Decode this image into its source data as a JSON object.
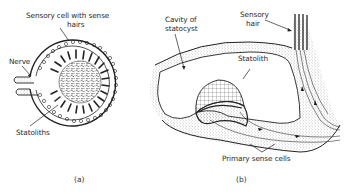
{
  "figure": {
    "panels": [
      {
        "id": "a",
        "caption": "(a)",
        "labels": {
          "sensory_cell": "Sensory cell with sense",
          "sensory_cell_line2": "hairs",
          "nerve": "Nerve",
          "statoliths": "Statoliths"
        }
      },
      {
        "id": "b",
        "caption": "(b)",
        "labels": {
          "cavity": "Cavity of",
          "cavity_line2": "statocyst",
          "sensory_hair": "Sensory",
          "sensory_hair_line2": "hair",
          "statolith": "Statolith",
          "primary_sense_cells": "Primary sense cells"
        }
      }
    ],
    "colors": {
      "ink": "#222222",
      "background": "#ffffff",
      "stipple": "#555555"
    }
  }
}
